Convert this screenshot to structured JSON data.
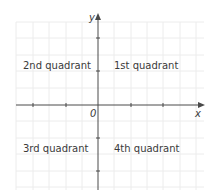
{
  "diagram": {
    "type": "cartesian-plane",
    "axes": {
      "x_label": "x",
      "y_label": "y",
      "origin_label": "0"
    },
    "quadrants": [
      {
        "id": "q1",
        "label": "1st quadrant"
      },
      {
        "id": "q2",
        "label": "2nd quadrant"
      },
      {
        "id": "q3",
        "label": "3rd quadrant"
      },
      {
        "id": "q4",
        "label": "4th quadrant"
      }
    ],
    "colors": {
      "axis": "#4a4a4a",
      "grid": "#ececec",
      "text": "#3a3a3a"
    }
  }
}
